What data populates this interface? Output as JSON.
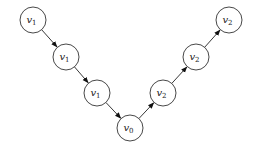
{
  "diagram": {
    "type": "directed-graph",
    "nodes": [
      {
        "id": "n1",
        "label": "v",
        "sub": "1",
        "x": 33,
        "y": 20
      },
      {
        "id": "n2",
        "label": "v",
        "sub": "1",
        "x": 66,
        "y": 57
      },
      {
        "id": "n3",
        "label": "v",
        "sub": "1",
        "x": 97,
        "y": 93
      },
      {
        "id": "n4",
        "label": "v",
        "sub": "0",
        "x": 130,
        "y": 128
      },
      {
        "id": "n5",
        "label": "v",
        "sub": "2",
        "x": 163,
        "y": 93
      },
      {
        "id": "n6",
        "label": "v",
        "sub": "2",
        "x": 196,
        "y": 57
      },
      {
        "id": "n7",
        "label": "v",
        "sub": "2",
        "x": 229,
        "y": 20
      }
    ],
    "edges": [
      {
        "from": "n1",
        "to": "n2"
      },
      {
        "from": "n2",
        "to": "n3"
      },
      {
        "from": "n3",
        "to": "n4"
      },
      {
        "from": "n4",
        "to": "n5"
      },
      {
        "from": "n5",
        "to": "n6"
      },
      {
        "from": "n6",
        "to": "n7"
      }
    ],
    "node_radius": 13
  }
}
